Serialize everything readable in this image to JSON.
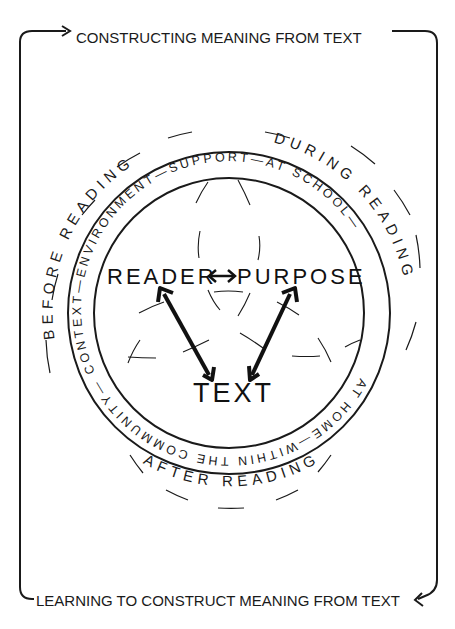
{
  "diagram": {
    "top_label": "CONSTRUCTING MEANING FROM TEXT",
    "bottom_label": "LEARNING TO CONSTRUCT MEANING FROM TEXT",
    "phases": {
      "before": "BEFORE READING",
      "during": "DURING READING",
      "after": "AFTER READING"
    },
    "ring": {
      "top": "CONTEXT—ENVIRONMENT—SUPPORT—AT SCHOOL—",
      "bottom": "COMMUNITY—WITHIN THE AT HOME—"
    },
    "ring_full": "CONTEXT—ENVIRONMENT—SUPPORT—AT SCHOOL—AT HOME—WITHIN THE COMMUNITY—",
    "core": {
      "reader": "READER",
      "purpose": "PURPOSE",
      "text": "TEXT",
      "reader_purpose_arrow": "↔"
    },
    "colors": {
      "ink": "#1a1a1a",
      "background": "#ffffff"
    }
  }
}
